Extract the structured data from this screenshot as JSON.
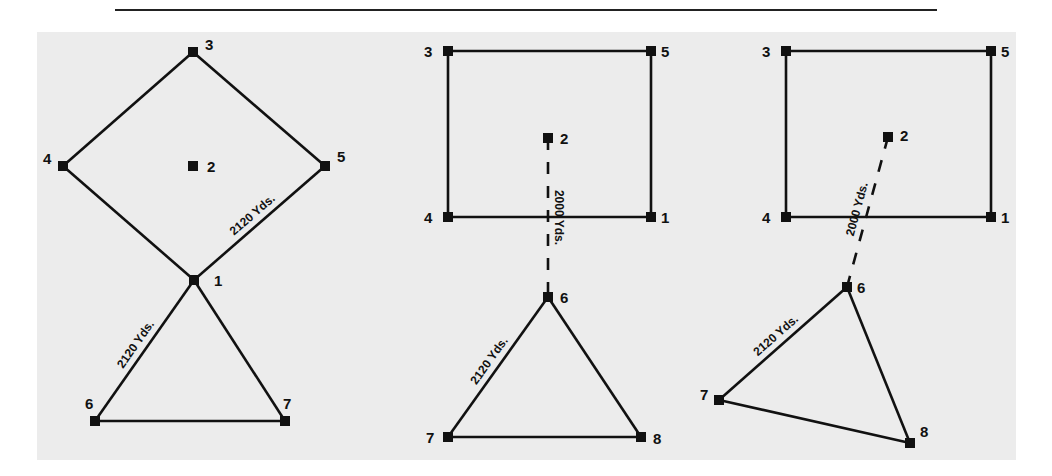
{
  "figure": {
    "background": "#ececec",
    "line_color": "#111111",
    "diagrams": [
      {
        "id": "diamond-triangle",
        "nodes": [
          {
            "id": "1",
            "label": "1",
            "x": 194,
            "y": 280
          },
          {
            "id": "2",
            "label": "2",
            "x": 193,
            "y": 166
          },
          {
            "id": "3",
            "label": "3",
            "x": 193,
            "y": 52
          },
          {
            "id": "4",
            "label": "4",
            "x": 63,
            "y": 166
          },
          {
            "id": "5",
            "label": "5",
            "x": 325,
            "y": 166
          },
          {
            "id": "6",
            "label": "6",
            "x": 95,
            "y": 421
          },
          {
            "id": "7",
            "label": "7",
            "x": 285,
            "y": 421
          }
        ],
        "edges": [
          {
            "from": "3",
            "to": "4",
            "style": "solid"
          },
          {
            "from": "3",
            "to": "5",
            "style": "solid"
          },
          {
            "from": "4",
            "to": "1",
            "style": "solid"
          },
          {
            "from": "5",
            "to": "1",
            "style": "solid"
          },
          {
            "from": "1",
            "to": "6",
            "style": "solid"
          },
          {
            "from": "1",
            "to": "7",
            "style": "solid"
          },
          {
            "from": "6",
            "to": "7",
            "style": "solid"
          }
        ],
        "distance_labels": [
          {
            "text": "2120 Yds.",
            "edge": "5-1"
          },
          {
            "text": "2120 Yds.",
            "edge": "1-6"
          }
        ]
      },
      {
        "id": "rectangle-triangle-straight",
        "nodes": [
          {
            "id": "1",
            "label": "1",
            "x": 651,
            "y": 217
          },
          {
            "id": "2",
            "label": "2",
            "x": 548,
            "y": 138
          },
          {
            "id": "3",
            "label": "3",
            "x": 448,
            "y": 51
          },
          {
            "id": "4",
            "label": "4",
            "x": 448,
            "y": 217
          },
          {
            "id": "5",
            "label": "5",
            "x": 651,
            "y": 51
          },
          {
            "id": "6",
            "label": "6",
            "x": 548,
            "y": 297
          },
          {
            "id": "7",
            "label": "7",
            "x": 448,
            "y": 437
          },
          {
            "id": "8",
            "label": "8",
            "x": 641,
            "y": 437
          }
        ],
        "edges": [
          {
            "from": "3",
            "to": "5",
            "style": "solid"
          },
          {
            "from": "5",
            "to": "1",
            "style": "solid"
          },
          {
            "from": "1",
            "to": "4",
            "style": "solid"
          },
          {
            "from": "4",
            "to": "3",
            "style": "solid"
          },
          {
            "from": "2",
            "to": "6",
            "style": "dashed"
          },
          {
            "from": "6",
            "to": "7",
            "style": "solid"
          },
          {
            "from": "6",
            "to": "8",
            "style": "solid"
          },
          {
            "from": "7",
            "to": "8",
            "style": "solid"
          }
        ],
        "distance_labels": [
          {
            "text": "2000 Yds.",
            "edge": "2-6"
          },
          {
            "text": "2120 Yds.",
            "edge": "6-7"
          }
        ]
      },
      {
        "id": "rectangle-triangle-rotated",
        "nodes": [
          {
            "id": "1",
            "label": "1",
            "x": 991,
            "y": 217
          },
          {
            "id": "2",
            "label": "2",
            "x": 888,
            "y": 137
          },
          {
            "id": "3",
            "label": "3",
            "x": 786,
            "y": 51
          },
          {
            "id": "4",
            "label": "4",
            "x": 786,
            "y": 217
          },
          {
            "id": "5",
            "label": "5",
            "x": 991,
            "y": 51
          },
          {
            "id": "6",
            "label": "6",
            "x": 847,
            "y": 287
          },
          {
            "id": "7",
            "label": "7",
            "x": 719,
            "y": 400
          },
          {
            "id": "8",
            "label": "8",
            "x": 910,
            "y": 443
          }
        ],
        "edges": [
          {
            "from": "3",
            "to": "5",
            "style": "solid"
          },
          {
            "from": "5",
            "to": "1",
            "style": "solid"
          },
          {
            "from": "1",
            "to": "4",
            "style": "solid"
          },
          {
            "from": "4",
            "to": "3",
            "style": "solid"
          },
          {
            "from": "2",
            "to": "6",
            "style": "dashed"
          },
          {
            "from": "6",
            "to": "7",
            "style": "solid"
          },
          {
            "from": "6",
            "to": "8",
            "style": "solid"
          },
          {
            "from": "7",
            "to": "8",
            "style": "solid"
          }
        ],
        "distance_labels": [
          {
            "text": "2000 Yds.",
            "edge": "2-6"
          },
          {
            "text": "2120 Yds.",
            "edge": "6-7"
          }
        ]
      }
    ]
  }
}
